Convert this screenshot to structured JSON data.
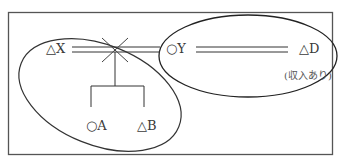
{
  "diagram": {
    "type": "family-relationship",
    "persons": {
      "x": {
        "label": "△X",
        "symbol": "triangle",
        "role": "former spouse"
      },
      "y": {
        "label": "○Y",
        "symbol": "circle",
        "role": "spouse of D"
      },
      "d": {
        "label": "△D",
        "symbol": "triangle",
        "note": "(収入あり)"
      },
      "a": {
        "label": "○A",
        "symbol": "circle",
        "role": "child of X"
      },
      "b": {
        "label": "△B",
        "symbol": "triangle",
        "role": "child of X"
      }
    },
    "relations": [
      {
        "from": "X",
        "to": "Y",
        "type": "marriage",
        "status": "divorced (crossed out)"
      },
      {
        "from": "Y",
        "to": "D",
        "type": "marriage"
      },
      {
        "from": "X-Y",
        "to": [
          "A",
          "B"
        ],
        "type": "children"
      }
    ],
    "groups": [
      {
        "name": "household-left",
        "members": [
          "X",
          "A",
          "B"
        ]
      },
      {
        "name": "household-right",
        "members": [
          "Y",
          "D"
        ]
      }
    ],
    "colors": {
      "line": "#333333",
      "frame": "#555555",
      "background": "#ffffff"
    }
  }
}
